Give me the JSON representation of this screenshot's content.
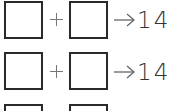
{
  "rows": [
    {
      "operator": "+",
      "arrow": "→",
      "result": "14"
    },
    {
      "operator": "+",
      "arrow": "→",
      "result": "14"
    },
    {
      "operator": "+",
      "arrow": "→",
      "result": ""
    }
  ],
  "colors": {
    "box_border": "#2a2a2a",
    "operator": "#777777",
    "text": "#333333"
  }
}
